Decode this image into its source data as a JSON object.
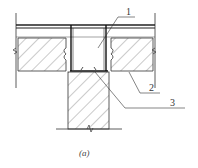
{
  "figure": {
    "caption": "(a)",
    "labels": [
      {
        "id": "1",
        "text": "1"
      },
      {
        "id": "2",
        "text": "2"
      },
      {
        "id": "3",
        "text": "3"
      }
    ],
    "colors": {
      "line": "#222222",
      "hatch": "#555555",
      "background": "#ffffff"
    }
  }
}
